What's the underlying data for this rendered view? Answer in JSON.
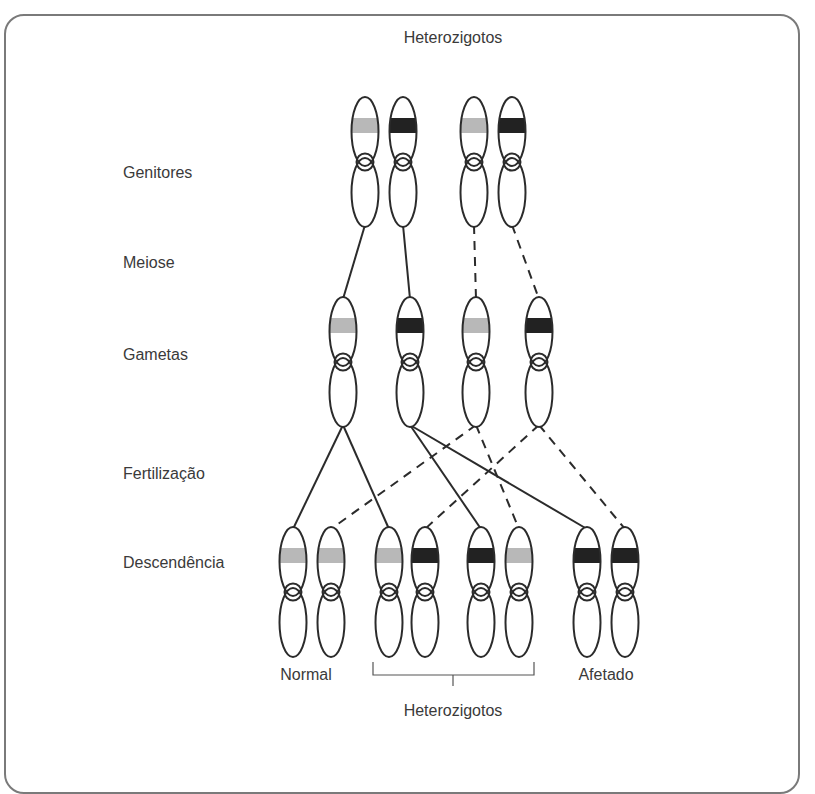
{
  "title": "Heterozigotos",
  "stages": [
    {
      "id": "genitores",
      "label": "Genitores",
      "y": 173
    },
    {
      "id": "meiose",
      "label": "Meiose",
      "y": 263
    },
    {
      "id": "gametas",
      "label": "Gametas",
      "y": 355
    },
    {
      "id": "fertilizacao",
      "label": "Fertilização",
      "y": 474
    },
    {
      "id": "descendencia",
      "label": "Descendência",
      "y": 563
    }
  ],
  "colors": {
    "normal_allele": "#b8b8b8",
    "mutant_allele": "#222222",
    "outline": "#2b2b2b",
    "frame": "#7a7a7a"
  },
  "parents": [
    {
      "x": 365,
      "allele": "normal",
      "parent": 1
    },
    {
      "x": 403,
      "allele": "mutant",
      "parent": 1
    },
    {
      "x": 474,
      "allele": "normal",
      "parent": 2
    },
    {
      "x": 512,
      "allele": "mutant",
      "parent": 2
    }
  ],
  "gametes": [
    {
      "x": 343,
      "allele": "normal",
      "from_parent": 1
    },
    {
      "x": 410,
      "allele": "mutant",
      "from_parent": 1
    },
    {
      "x": 476,
      "allele": "normal",
      "from_parent": 2
    },
    {
      "x": 539,
      "allele": "mutant",
      "from_parent": 2
    }
  ],
  "offspring": [
    {
      "x": 293,
      "allele": "normal"
    },
    {
      "x": 331,
      "allele": "normal"
    },
    {
      "x": 389,
      "allele": "normal"
    },
    {
      "x": 425,
      "allele": "mutant"
    },
    {
      "x": 481,
      "allele": "mutant"
    },
    {
      "x": 519,
      "allele": "normal"
    },
    {
      "x": 587,
      "allele": "mutant"
    },
    {
      "x": 625,
      "allele": "mutant"
    }
  ],
  "meiosis_links": [
    {
      "from": 0,
      "to": 0,
      "style": "solid"
    },
    {
      "from": 1,
      "to": 1,
      "style": "solid"
    },
    {
      "from": 2,
      "to": 2,
      "style": "dashed"
    },
    {
      "from": 3,
      "to": 3,
      "style": "dashed"
    }
  ],
  "fertilization_links": [
    {
      "gamete": 0,
      "offspring": 0,
      "style": "solid"
    },
    {
      "gamete": 0,
      "offspring": 2,
      "style": "solid"
    },
    {
      "gamete": 1,
      "offspring": 4,
      "style": "solid"
    },
    {
      "gamete": 1,
      "offspring": 6,
      "style": "solid"
    },
    {
      "gamete": 2,
      "offspring": 1,
      "style": "dashed"
    },
    {
      "gamete": 2,
      "offspring": 5,
      "style": "dashed"
    },
    {
      "gamete": 3,
      "offspring": 3,
      "style": "dashed"
    },
    {
      "gamete": 3,
      "offspring": 7,
      "style": "dashed"
    }
  ],
  "offspring_labels": {
    "normal": "Normal",
    "heterozygous": "Heterozigotos",
    "affected": "Afetado"
  }
}
